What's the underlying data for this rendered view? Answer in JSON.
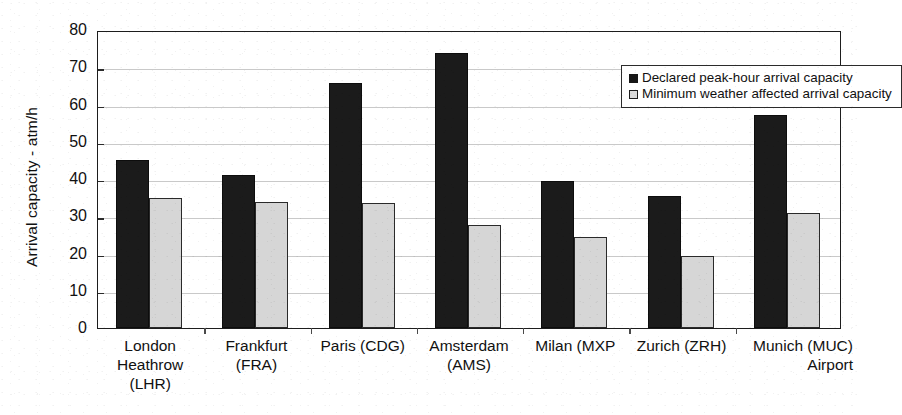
{
  "chart_data": {
    "type": "bar",
    "title": "",
    "xlabel": "",
    "ylabel": "Arrival capacity - atm/h",
    "ylim": [
      0,
      80
    ],
    "ytick_step": 10,
    "yticks": [
      "0",
      "10",
      "20",
      "30",
      "40",
      "50",
      "60",
      "70",
      "80"
    ],
    "grid": true,
    "legend_position": "top-right inside plot",
    "categories": [
      "London\nHeathrow\n(LHR)",
      "Frankfurt\n(FRA)",
      "Paris (CDG)",
      "Amsterdam\n(AMS)",
      "Milan (MXP",
      "Zurich (ZRH)",
      "Munich (MUC)\nAirport"
    ],
    "series": [
      {
        "name": "Declared peak-hour arrival capacity",
        "color": "#1b1b1b",
        "values": [
          45.2,
          41.0,
          65.8,
          73.8,
          39.5,
          35.4,
          57.2
        ]
      },
      {
        "name": "Minimum weather affected arrival capacity",
        "color": "#d6d6d6",
        "values": [
          35.0,
          33.7,
          33.6,
          27.6,
          24.4,
          19.4,
          31.0
        ]
      }
    ]
  },
  "legend": {
    "entries": [
      "Declared peak-hour arrival capacity",
      "Minimum weather affected arrival capacity"
    ]
  },
  "colors": {
    "series_dark": "#1b1b1b",
    "series_light": "#d6d6d6",
    "axis": "#1d1d1d",
    "gridline": "#c9c9c9",
    "background": "#ffffff"
  }
}
